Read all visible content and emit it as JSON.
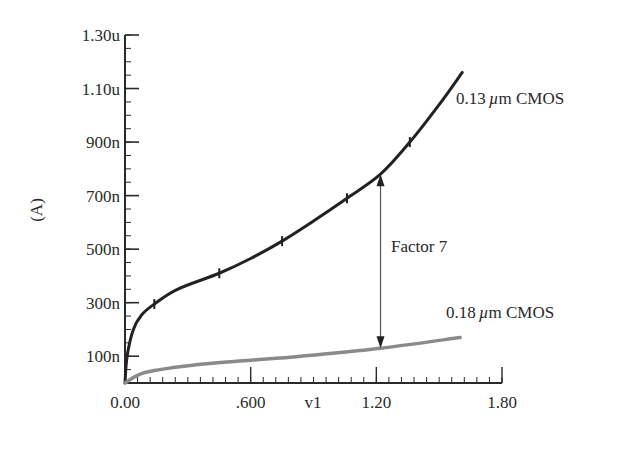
{
  "chart_data": {
    "type": "line",
    "title": "",
    "xlabel": "v1",
    "ylabel": "(A)",
    "xlim": [
      0,
      1.8
    ],
    "ylim": [
      0,
      1.3e-06
    ],
    "grid": false,
    "x_ticks": [
      {
        "value": 0.0,
        "label": "0.00"
      },
      {
        "value": 0.6,
        "label": ".600"
      },
      {
        "value": 1.2,
        "label": "1.20"
      },
      {
        "value": 1.8,
        "label": "1.80"
      }
    ],
    "y_ticks": [
      {
        "value": 1e-07,
        "label": "100n"
      },
      {
        "value": 3e-07,
        "label": "300n"
      },
      {
        "value": 5e-07,
        "label": "500n"
      },
      {
        "value": 7e-07,
        "label": "700n"
      },
      {
        "value": 9e-07,
        "label": "900n"
      },
      {
        "value": 1.1e-06,
        "label": "1.10u"
      },
      {
        "value": 1.3e-06,
        "label": "1.30u"
      }
    ],
    "series": [
      {
        "name": "0.13 µm CMOS",
        "color": "#222222",
        "x": [
          0.0,
          0.01,
          0.04,
          0.08,
          0.14,
          0.25,
          0.45,
          0.6,
          0.75,
          0.9,
          1.06,
          1.22,
          1.36,
          1.5,
          1.61
        ],
        "y": [
          0.0,
          1e-07,
          2e-07,
          2.55e-07,
          2.95e-07,
          3.5e-07,
          4.1e-07,
          4.65e-07,
          5.3e-07,
          6.05e-07,
          6.9e-07,
          7.8e-07,
          9e-07,
          1.04e-06,
          1.16e-06
        ],
        "markers_at_x": [
          0.14,
          0.45,
          0.75,
          1.06,
          1.36
        ]
      },
      {
        "name": "0.18 µm CMOS",
        "color": "#8a8a8a",
        "x": [
          0.0,
          0.1,
          0.36,
          0.6,
          0.84,
          1.22,
          1.6
        ],
        "y": [
          0.0,
          4e-08,
          7e-08,
          8.5e-08,
          1e-07,
          1.3e-07,
          1.7e-07
        ]
      }
    ],
    "annotations": [
      {
        "text": "0.13 µm CMOS",
        "near_series": "0.13 µm CMOS"
      },
      {
        "text": "0.18 µm CMOS",
        "near_series": "0.18 µm CMOS"
      },
      {
        "text": "Factor 7",
        "type": "double-arrow",
        "x": 1.22,
        "y_from": 1.3e-07,
        "y_to": 7.8e-07
      }
    ],
    "legend": "none (inline labels)"
  },
  "labels": {
    "xlabel": "v1",
    "ylabel": "(A)",
    "series1": {
      "prefix": "0.13",
      "mu": "µ",
      "suffix": "m CMOS"
    },
    "series2": {
      "prefix": "0.18",
      "mu": "µ",
      "suffix": "m CMOS"
    },
    "factor": "Factor 7"
  },
  "colors": {
    "axis": "#2a2a2a",
    "series1": "#222222",
    "series2": "#8a8a8a",
    "arrow": "#555555"
  }
}
